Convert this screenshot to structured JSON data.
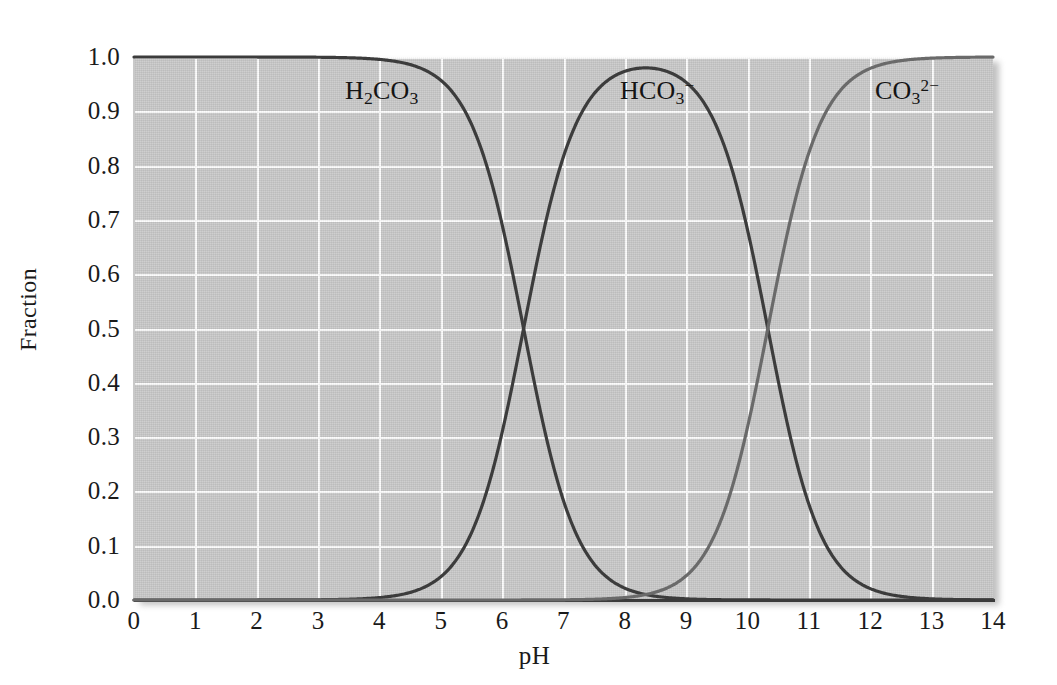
{
  "chart_data": {
    "type": "line",
    "title": "",
    "xlabel": "pH",
    "ylabel": "Fraction",
    "xlim": [
      0,
      14
    ],
    "ylim": [
      0,
      1.0
    ],
    "grid": true,
    "legend_position": "inline-annotations",
    "xticks": [
      "0",
      "1",
      "2",
      "3",
      "4",
      "5",
      "6",
      "7",
      "8",
      "9",
      "10",
      "11",
      "12",
      "13",
      "14"
    ],
    "yticks": [
      "0.0",
      "0.1",
      "0.2",
      "0.3",
      "0.4",
      "0.5",
      "0.6",
      "0.7",
      "0.8",
      "0.9",
      "1.0"
    ],
    "x": [
      0,
      0.5,
      1,
      1.5,
      2,
      2.5,
      3,
      3.5,
      4,
      4.5,
      5,
      5.5,
      6,
      6.35,
      6.5,
      7,
      7.5,
      8,
      8.35,
      8.5,
      9,
      9.5,
      10,
      10.33,
      10.5,
      11,
      11.5,
      12,
      12.5,
      13,
      13.5,
      14
    ],
    "pka1": 6.35,
    "pka2": 10.33,
    "crossings": [
      {
        "pH": 6.35,
        "fraction": 0.5,
        "species": [
          "H2CO3",
          "HCO3-"
        ]
      },
      {
        "pH": 10.33,
        "fraction": 0.5,
        "species": [
          "HCO3-",
          "CO3 2-"
        ]
      }
    ],
    "series": [
      {
        "name": "H2CO3",
        "label_html": "H<sub>2</sub>CO<sub>3</sub>",
        "label_plain": "H2CO3",
        "color": "#3c3c3c",
        "values": [
          1.0,
          1.0,
          1.0,
          1.0,
          1.0,
          0.999,
          0.996,
          0.986,
          0.957,
          0.876,
          0.693,
          0.416,
          0.691,
          0.5,
          0.414,
          0.183,
          0.066,
          0.022,
          0.0099,
          0.007,
          0.0022,
          0.0007,
          0.0002,
          0.0001,
          0.0001,
          0.0,
          0.0,
          0.0,
          0.0,
          0.0,
          0.0,
          0.0
        ]
      },
      {
        "name": "HCO3-",
        "label_html": "HCO<sub>3</sub><sup>&#8722;</sup>",
        "label_plain": "HCO3-",
        "color": "#3c3c3c",
        "values": [
          0.0,
          0.0,
          0.0,
          0.0,
          0.0,
          0.001,
          0.004,
          0.014,
          0.043,
          0.124,
          0.307,
          0.584,
          0.817,
          0.5,
          0.934,
          0.966,
          0.987,
          0.978,
          0.98,
          0.985,
          0.955,
          0.871,
          0.682,
          0.5,
          0.403,
          0.175,
          0.063,
          0.021,
          0.0068,
          0.0021,
          0.0007,
          0.0002
        ]
      },
      {
        "name": "CO3 2-",
        "label_html": "CO<sub>3</sub><sup>2&#8722;</sup>",
        "label_plain": "CO3 2-",
        "color": "#6a6a6a",
        "values": [
          0.0,
          0.0,
          0.0,
          0.0,
          0.0,
          0.0,
          0.0,
          0.0,
          0.0,
          0.0,
          0.0,
          0.0,
          0.0,
          0.0,
          0.0,
          0.0,
          0.001,
          0.003,
          0.01,
          0.015,
          0.045,
          0.128,
          0.318,
          0.5,
          0.597,
          0.824,
          0.937,
          0.979,
          0.993,
          0.998,
          0.999,
          1.0
        ]
      }
    ]
  },
  "labels": {
    "h2co3": "H2CO3",
    "hco3": "HCO3-",
    "co32": "CO3 2-"
  },
  "colors": {
    "plot_background": "#c9c9c9",
    "gridline": "#fdfdfd",
    "axis": "#3a3a3a",
    "curve_dark": "#3c3c3c",
    "curve_gray": "#6a6a6a",
    "text": "#141414"
  }
}
